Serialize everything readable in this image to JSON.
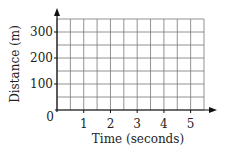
{
  "chart_data": {
    "type": "line",
    "title": "",
    "xlabel": "Time (seconds)",
    "ylabel": "Distance (m)",
    "x_ticks": [
      1,
      2,
      3,
      4,
      5
    ],
    "y_ticks": [
      100,
      200,
      300
    ],
    "origin_label": "0",
    "xlim": [
      0,
      5.5
    ],
    "ylim": [
      0,
      350
    ],
    "grid": true,
    "grid_x_step": 0.5,
    "grid_y_step": 50,
    "series": [],
    "legend": null
  },
  "colors": {
    "grid": "#777777",
    "axis": "#111111",
    "text": "#222222"
  }
}
